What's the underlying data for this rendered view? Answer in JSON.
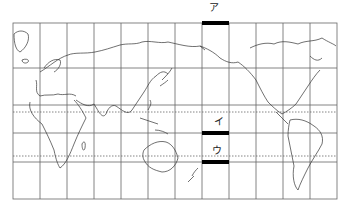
{
  "map": {
    "projection": "equirectangular, Pacific-centered world map",
    "frame": {
      "x0": 13,
      "y0": 23,
      "x1": 337,
      "y1": 199
    },
    "meridian_lines_x": [
      40,
      67,
      94,
      121,
      148,
      175,
      202,
      229,
      256,
      283,
      310
    ],
    "parallel_lines_solid_y": [
      68,
      105,
      133,
      162
    ],
    "parallel_lines_dotted_y": [
      112,
      156
    ],
    "highlight_bars": [
      {
        "id": "a",
        "label": "ア",
        "x0": 202,
        "x1": 229,
        "y": 23,
        "label_x": 209,
        "label_y": 3
      },
      {
        "id": "i",
        "label": "イ",
        "x0": 202,
        "x1": 229,
        "y": 133,
        "label_x": 214,
        "label_y": 117
      },
      {
        "id": "u",
        "label": "ウ",
        "x0": 202,
        "x1": 229,
        "y": 162,
        "label_x": 212,
        "label_y": 146
      }
    ],
    "colors": {
      "line": "#555555",
      "coast": "#333333",
      "bar": "#000000",
      "background": "#ffffff"
    }
  }
}
